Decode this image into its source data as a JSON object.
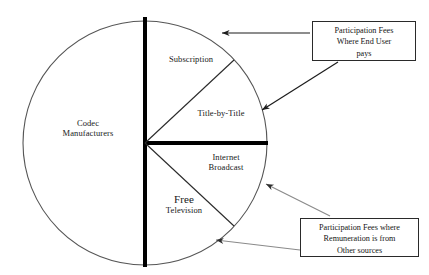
{
  "diagram": {
    "type": "pie-sector-diagram",
    "title": "",
    "circle": {
      "center_x": 145,
      "center_y": 143,
      "radius": 122,
      "outline_color": "#555555"
    },
    "sectors": [
      {
        "id": "codec-manufacturers",
        "label_line1": "Codec",
        "label_line2": "Manufacturers",
        "start_angle_deg": 90,
        "end_angle_deg": 270,
        "span_deg": 180
      },
      {
        "id": "subscription",
        "label_line1": "Subscription",
        "label_line2": "",
        "start_angle_deg": 43,
        "end_angle_deg": 90,
        "span_deg": 47
      },
      {
        "id": "title-by-title",
        "label_line1": "Title-by-Title",
        "label_line2": "",
        "start_angle_deg": 0,
        "end_angle_deg": 43,
        "span_deg": 43
      },
      {
        "id": "internet-broadcast",
        "label_line1": "Internet",
        "label_line2": "Broadcast",
        "start_angle_deg": -43,
        "end_angle_deg": 0,
        "span_deg": 43
      },
      {
        "id": "free-television",
        "label_line1": "Free",
        "label_line2": "Television",
        "start_angle_deg": -90,
        "end_angle_deg": -43,
        "span_deg": 47
      }
    ],
    "dividers": [
      {
        "id": "vertical-diameter",
        "weight": "thick",
        "color": "#000000"
      },
      {
        "id": "horizontal-radius",
        "weight": "thick",
        "color": "#000000"
      },
      {
        "id": "upper-diagonal-radius",
        "weight": "thin",
        "color": "#2a2a2a"
      },
      {
        "id": "lower-diagonal-radius",
        "weight": "thin",
        "color": "#2a2a2a"
      }
    ]
  },
  "callouts": [
    {
      "id": "end-user",
      "line1": "Participation Fees",
      "line2": "Where End User",
      "line3": "pays",
      "arrow_color": "#1c1c1c",
      "targets": [
        "subscription-arc",
        "title-by-title-arc"
      ]
    },
    {
      "id": "other-sources",
      "line1": "Participation Fees where",
      "line2": "Remuneration is from",
      "line3": "Other sources",
      "arrow_color": "#8a8a8a",
      "targets": [
        "internet-broadcast-arc",
        "free-television-arc"
      ]
    }
  ]
}
